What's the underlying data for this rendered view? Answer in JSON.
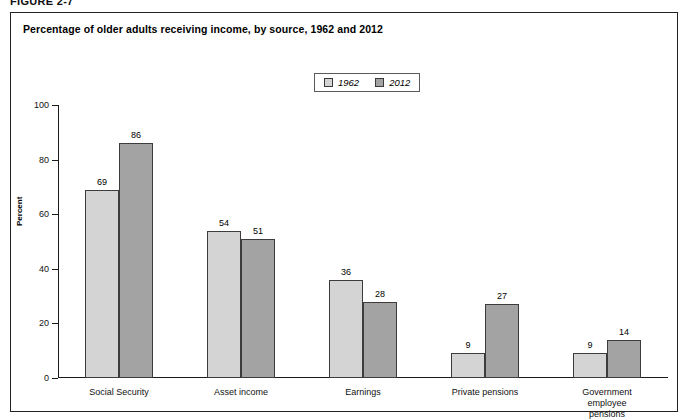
{
  "figure": {
    "label": "FIGURE 2-7",
    "title": "Percentage of older adults receiving income, by source, 1962 and 2012"
  },
  "legend": {
    "position": "top-center",
    "entries": [
      {
        "label": "1962",
        "color": "#d4d4d4"
      },
      {
        "label": "2012",
        "color": "#a3a3a3"
      }
    ]
  },
  "colors": {
    "series_1962": "#d4d4d4",
    "series_2012": "#a3a3a3",
    "bar_border": "#3c3c3c",
    "axis": "#1a1a1a",
    "frame": "#222222"
  },
  "chart_data": {
    "type": "bar",
    "title": "Percentage of older adults receiving income, by source, 1962 and 2012",
    "xlabel": "",
    "ylabel": "Percent",
    "ylim": [
      0,
      100
    ],
    "yticks": [
      0,
      20,
      40,
      60,
      80,
      100
    ],
    "grid": false,
    "legend_position": "top-center",
    "categories": [
      "Social Security",
      "Asset income",
      "Earnings",
      "Private pensions",
      "Government\nemployee pensions"
    ],
    "series": [
      {
        "name": "1962",
        "values": [
          69,
          54,
          36,
          9,
          9
        ]
      },
      {
        "name": "2012",
        "values": [
          86,
          51,
          28,
          27,
          14
        ]
      }
    ]
  }
}
